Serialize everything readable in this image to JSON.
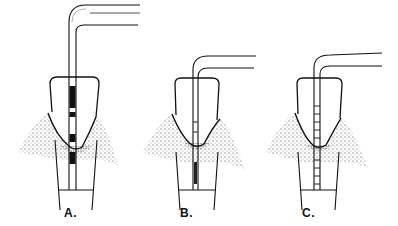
{
  "diagram": {
    "type": "periodontal probe illustration",
    "panels": [
      {
        "label": "A.",
        "probe_style": "banded (black color-coded bands)",
        "x_center": 76,
        "label_x": 64
      },
      {
        "label": "B.",
        "probe_style": "thin probe with small marks",
        "x_center": 190,
        "label_x": 180
      },
      {
        "label": "C.",
        "probe_style": "graduated (ladder millimeter marks)",
        "x_center": 312,
        "label_x": 302
      }
    ],
    "colors": {
      "ink": "#111111",
      "paper": "#ffffff",
      "stipple": "#333333"
    }
  }
}
